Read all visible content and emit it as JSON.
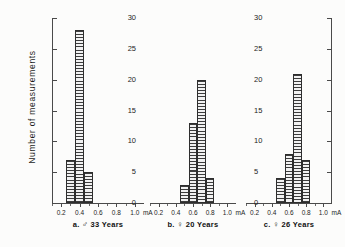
{
  "chart_data": {
    "type": "bar",
    "title": "",
    "ylabel": "Number  of  measurements",
    "xlabel": "mA",
    "ylim": [
      0,
      30
    ],
    "ytick_values": [
      0,
      5,
      10,
      15,
      20,
      25,
      30
    ],
    "ytick_labels": [
      "0",
      "5",
      "10",
      "15",
      "20",
      "25",
      "30"
    ],
    "left_axis_labels": [
      "0",
      "5",
      "10",
      "15",
      "20",
      "25",
      "30"
    ],
    "right_axis_labels": [
      "0",
      "5",
      "10",
      "15",
      "20",
      "25",
      "30"
    ],
    "xlim": [
      0.1,
      1.1
    ],
    "xtick_values": [
      0.2,
      0.4,
      0.6,
      0.8,
      1.0
    ],
    "xtick_labels": [
      "0.2",
      "0.4",
      "0.6",
      "0.8",
      "1.0"
    ],
    "xunit_label": "mA",
    "grid": false,
    "legend": "none",
    "bin_width": 0.1,
    "panels": [
      {
        "id": "a",
        "caption_prefix": "a.",
        "caption_symbol": "♂",
        "caption_text": "33 Years",
        "caption_full": "a. ♂ 33 Years",
        "categories": [
          "0.3",
          "0.4",
          "0.5"
        ],
        "bin_starts": [
          0.25,
          0.35,
          0.45
        ],
        "values": [
          7,
          28,
          5
        ]
      },
      {
        "id": "b",
        "caption_prefix": "b.",
        "caption_symbol": "♀",
        "caption_text": "20 Years",
        "caption_full": "b. ♀ 20 Years",
        "categories": [
          "0.5",
          "0.6",
          "0.7",
          "0.8"
        ],
        "bin_starts": [
          0.45,
          0.55,
          0.65,
          0.75
        ],
        "values": [
          3,
          13,
          20,
          4
        ]
      },
      {
        "id": "c",
        "caption_prefix": "c.",
        "caption_symbol": "♀",
        "caption_text": "26 Years",
        "caption_full": "c. ♀ 26 Years",
        "categories": [
          "0.5",
          "0.6",
          "0.7",
          "0.8"
        ],
        "bin_starts": [
          0.45,
          0.55,
          0.65,
          0.75
        ],
        "values": [
          4,
          8,
          21,
          7
        ]
      }
    ]
  }
}
